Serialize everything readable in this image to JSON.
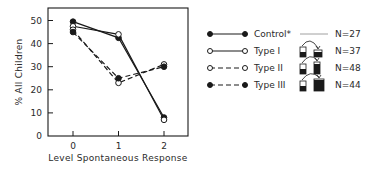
{
  "chart_data": {
    "type": "line",
    "title": "",
    "xlabel": "Level Spontaneous Response",
    "ylabel": "% All Children",
    "x": [
      0,
      1,
      2
    ],
    "categories": [
      "0",
      "1",
      "2"
    ],
    "yticks": [
      0,
      10,
      20,
      30,
      40,
      50
    ],
    "ylim": [
      0,
      53
    ],
    "grid": false,
    "legend_position": "right",
    "series": [
      {
        "name": "Control*",
        "marker": "filled",
        "line": "solid",
        "n_label": "N=27",
        "icon": "none",
        "values": [
          49.5,
          42.5,
          8
        ]
      },
      {
        "name": "Type I",
        "marker": "open",
        "line": "solid",
        "n_label": "N=37",
        "icon": "beaker-transfer-equal-wide",
        "values": [
          47.5,
          44,
          7
        ]
      },
      {
        "name": "Type II",
        "marker": "open",
        "line": "dashed",
        "n_label": "N=48",
        "icon": "beaker-transfer-tall-narrow",
        "values": [
          46,
          23,
          31
        ]
      },
      {
        "name": "Type III",
        "marker": "filled",
        "line": "dashed",
        "n_label": "N=44",
        "icon": "beaker-transfer-wide-large",
        "values": [
          45,
          25,
          30
        ]
      }
    ]
  },
  "colors": {
    "ink": "#1a1a1a",
    "background": "#ffffff"
  }
}
